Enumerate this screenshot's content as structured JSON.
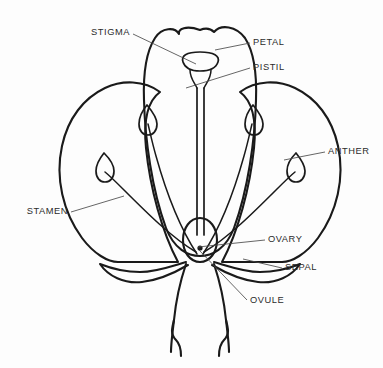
{
  "diagram": {
    "style": "line-drawing",
    "background_color": "#fdfdfd",
    "ink_color": "#1a1a1a",
    "leader_color": "#4a4a4a",
    "labels": [
      {
        "id": "stigma",
        "text": "STIGMA",
        "x": 130,
        "y": 33,
        "align": "end",
        "leader": "M133,34 L196,64"
      },
      {
        "id": "petal",
        "text": "PETAL",
        "x": 253,
        "y": 43,
        "align": "start",
        "leader": "M250,43 L215,50"
      },
      {
        "id": "pistil",
        "text": "PISTIL",
        "x": 253,
        "y": 68,
        "align": "start",
        "leader": "M250,68 L186,88"
      },
      {
        "id": "anther",
        "text": "ANTHER",
        "x": 328,
        "y": 152,
        "align": "start",
        "leader": "M325,152 L284,160"
      },
      {
        "id": "stamen",
        "text": "STAMEN",
        "x": 68,
        "y": 212,
        "align": "end",
        "leader": "M71,212 L124,196"
      },
      {
        "id": "ovary",
        "text": "OVARY",
        "x": 268,
        "y": 240,
        "align": "start",
        "leader": "M265,240 L198,247"
      },
      {
        "id": "sepal",
        "text": "SEPAL",
        "x": 285,
        "y": 268,
        "align": "start",
        "leader": "M282,268 L243,259"
      },
      {
        "id": "ovule",
        "text": "OVULE",
        "x": 250,
        "y": 301,
        "align": "start",
        "leader": "M247,300 L199,250"
      }
    ],
    "parts": {
      "center_petal": "M200,30 C186,25 178,29 179,34 C175,27 162,27 155,38 C146,52 143,72 144,100 C145,140 152,190 166,228 C174,249 188,256 200,256 C212,256 226,249 234,228 C248,190 255,140 256,100 C257,72 254,52 245,38 C236,26 221,24 214,32 C210,28 205,28 200,30 Z",
      "left_petal": "M160,92 C144,80 122,80 105,88 C84,98 68,118 62,146 C55,178 63,212 82,238 C94,254 108,262 118,262 L178,262 C162,232 150,188 146,148 C143,118 149,100 160,92 Z",
      "right_petal": "M240,92 C256,80 278,80 295,88 C316,98 332,118 338,146 C345,178 337,212 318,238 C306,254 292,262 282,262 L222,262 C238,232 250,188 254,148 C257,118 251,100 240,92 Z",
      "style": "M197,88 L197,235",
      "style_right": "M204,88 L204,235",
      "stigma_cap": "M183,62 C181,56 186,52 200,52 C214,52 220,56 218,62 C216,68 209,71 200,71 C191,71 185,68 183,62 Z",
      "stigma_neck_left": "M190,70 C190,78 194,82 197,88",
      "stigma_neck_right": "M211,70 C211,78 207,82 204,88",
      "ovary": "M200,218 C190,218 183,228 183,240 C183,252 190,262 200,262 C210,262 217,252 217,240 C217,228 210,218 200,218 Z",
      "ovule_dot_x": 200,
      "ovule_dot_y": 248,
      "ovule_dot_r": 2.6,
      "sepal_left": "M186,262 C172,266 156,272 140,272 C124,272 110,268 100,264 C108,276 124,284 142,282 C160,280 176,272 188,265",
      "sepal_right": "M214,262 C228,266 244,272 260,272 C276,272 290,268 300,264 C292,276 276,284 258,282 C240,280 224,272 212,265",
      "receptacle_left": "M186,264 C180,282 176,300 174,320 C172,336 171,344 171,352",
      "receptacle_right": "M214,264 C220,282 224,300 226,320 C228,336 229,344 229,352",
      "stem_left": "M174,320 C172,328 170,334 176,340 C180,344 181,348 181,356",
      "stem_right": "M226,320 C228,328 230,334 224,340 C220,344 219,348 219,356"
    },
    "stamens": [
      {
        "id": "stamen-outer-left",
        "filament": "M196,252 C172,238 146,212 124,190 C116,182 110,176 105,172",
        "anther": "M104,153 C100,158 96,165 96,171 C96,178 100,182 105,182 C110,182 114,178 114,171 C114,165 109,158 104,153 Z"
      },
      {
        "id": "stamen-inner-left",
        "filament": "M197,254 C180,228 166,192 156,156 C152,142 150,132 148,124",
        "anther": "M147,105 C142,111 139,118 139,124 C139,131 143,135 148,135 C153,135 157,131 157,124 C157,118 152,111 147,105 Z"
      },
      {
        "id": "stamen-inner-right",
        "filament": "M203,254 C220,228 234,192 244,156 C248,142 250,132 252,124",
        "anther": "M253,105 C248,111 245,118 245,124 C245,131 249,135 254,135 C259,135 263,131 263,124 C263,118 258,111 253,105 Z"
      },
      {
        "id": "stamen-outer-right",
        "filament": "M204,252 C228,238 254,212 276,190 C284,182 290,176 295,172",
        "anther": "M296,153 C291,158 287,165 287,171 C287,178 291,182 296,182 C301,182 305,178 305,171 C305,165 300,158 296,153 Z"
      }
    ]
  }
}
